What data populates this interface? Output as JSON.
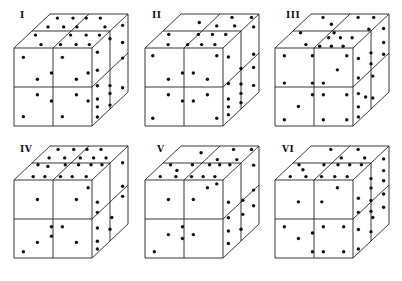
{
  "figure": {
    "line_color": "#222222",
    "dot_color": "#111111",
    "background": "#ffffff"
  },
  "cubes": [
    {
      "label": "I",
      "origin": [
        14,
        48
      ],
      "size": 78,
      "depth": [
        36,
        -34
      ],
      "label_pos": [
        20,
        10
      ],
      "front": [
        [
          0.12,
          0.12
        ],
        [
          0.3,
          0.4
        ],
        [
          0.48,
          0.68
        ],
        [
          0.62,
          0.12
        ],
        [
          0.8,
          0.4
        ],
        [
          0.95,
          0.68
        ],
        [
          0.12,
          0.88
        ],
        [
          0.3,
          0.6
        ],
        [
          0.48,
          0.32
        ],
        [
          0.62,
          0.88
        ],
        [
          0.8,
          0.6
        ],
        [
          0.95,
          0.32
        ]
      ],
      "top": [
        [
          0.15,
          0.12
        ],
        [
          0.35,
          0.12
        ],
        [
          0.52,
          0.12
        ],
        [
          0.7,
          0.12
        ],
        [
          0.15,
          0.38
        ],
        [
          0.35,
          0.38
        ],
        [
          0.52,
          0.38
        ],
        [
          0.88,
          0.38
        ],
        [
          0.1,
          0.62
        ],
        [
          0.55,
          0.62
        ],
        [
          0.75,
          0.62
        ],
        [
          0.92,
          0.62
        ],
        [
          0.3,
          0.9
        ],
        [
          0.55,
          0.9
        ],
        [
          0.75,
          0.9
        ],
        [
          0.92,
          0.9
        ]
      ],
      "right": [
        [
          0.15,
          0.12
        ],
        [
          0.5,
          0.1
        ],
        [
          0.85,
          0.08
        ],
        [
          0.15,
          0.35
        ],
        [
          0.85,
          0.3
        ],
        [
          0.15,
          0.55
        ],
        [
          0.85,
          0.5
        ],
        [
          0.15,
          0.72
        ],
        [
          0.5,
          0.7
        ],
        [
          0.15,
          0.82
        ],
        [
          0.5,
          0.8
        ],
        [
          0.15,
          0.95
        ],
        [
          0.5,
          0.95
        ],
        [
          0.85,
          0.88
        ]
      ]
    },
    {
      "label": "II",
      "origin": [
        145,
        48
      ],
      "size": 78,
      "depth": [
        36,
        -34
      ],
      "label_pos": [
        152,
        10
      ],
      "front": [
        [
          0.1,
          0.1
        ],
        [
          0.3,
          0.4
        ],
        [
          0.48,
          0.68
        ],
        [
          0.62,
          0.68
        ],
        [
          0.8,
          0.4
        ],
        [
          0.92,
          0.1
        ],
        [
          0.48,
          0.32
        ],
        [
          0.3,
          0.6
        ],
        [
          0.1,
          0.9
        ],
        [
          0.62,
          0.32
        ],
        [
          0.8,
          0.6
        ],
        [
          0.92,
          0.9
        ]
      ],
      "top": [
        [
          0.35,
          0.25
        ],
        [
          0.7,
          0.1
        ],
        [
          0.95,
          0.1
        ],
        [
          0.62,
          0.35
        ],
        [
          0.85,
          0.35
        ],
        [
          0.12,
          0.6
        ],
        [
          0.5,
          0.6
        ],
        [
          0.68,
          0.6
        ],
        [
          0.85,
          0.6
        ],
        [
          0.25,
          0.9
        ],
        [
          0.5,
          0.9
        ],
        [
          0.68,
          0.9
        ],
        [
          0.85,
          0.9
        ]
      ],
      "right": [
        [
          0.15,
          0.18
        ],
        [
          0.85,
          0.1
        ],
        [
          0.15,
          0.52
        ],
        [
          0.5,
          0.48
        ],
        [
          0.85,
          0.45
        ],
        [
          0.15,
          0.72
        ],
        [
          0.5,
          0.68
        ],
        [
          0.85,
          0.62
        ],
        [
          0.15,
          0.82
        ],
        [
          0.5,
          0.8
        ],
        [
          0.15,
          0.92
        ],
        [
          0.5,
          0.92
        ],
        [
          0.85,
          0.85
        ]
      ]
    },
    {
      "label": "III",
      "origin": [
        275,
        48
      ],
      "size": 78,
      "depth": [
        36,
        -34
      ],
      "label_pos": [
        286,
        10
      ],
      "front": [
        [
          0.12,
          0.1
        ],
        [
          0.48,
          0.1
        ],
        [
          0.12,
          0.45
        ],
        [
          0.48,
          0.45
        ],
        [
          0.62,
          0.45
        ],
        [
          0.8,
          0.28
        ],
        [
          0.92,
          0.1
        ],
        [
          0.48,
          0.6
        ],
        [
          0.3,
          0.75
        ],
        [
          0.12,
          0.92
        ],
        [
          0.62,
          0.6
        ],
        [
          0.92,
          0.6
        ],
        [
          0.62,
          0.92
        ],
        [
          0.92,
          0.92
        ]
      ],
      "top": [
        [
          0.2,
          0.1
        ],
        [
          0.4,
          0.3
        ],
        [
          0.55,
          0.55
        ],
        [
          0.65,
          0.1
        ],
        [
          0.85,
          0.1
        ],
        [
          0.12,
          0.55
        ],
        [
          0.35,
          0.9
        ],
        [
          0.95,
          0.45
        ],
        [
          0.55,
          0.7
        ],
        [
          0.7,
          0.7
        ],
        [
          0.85,
          0.7
        ],
        [
          0.55,
          0.95
        ],
        [
          0.7,
          0.95
        ],
        [
          0.85,
          0.95
        ]
      ],
      "right": [
        [
          0.15,
          0.2
        ],
        [
          0.85,
          0.12
        ],
        [
          0.5,
          0.28
        ],
        [
          0.85,
          0.3
        ],
        [
          0.15,
          0.45
        ],
        [
          0.5,
          0.42
        ],
        [
          0.85,
          0.45
        ],
        [
          0.15,
          0.65
        ],
        [
          0.55,
          0.6
        ],
        [
          0.15,
          0.82
        ],
        [
          0.35,
          0.78
        ],
        [
          0.55,
          0.88
        ],
        [
          0.15,
          0.95
        ]
      ]
    },
    {
      "label": "IV",
      "origin": [
        14,
        180
      ],
      "size": 78,
      "depth": [
        36,
        -34
      ],
      "label_pos": [
        20,
        144
      ],
      "front": [
        [
          0.3,
          0.25
        ],
        [
          0.48,
          0.6
        ],
        [
          0.8,
          0.25
        ],
        [
          0.95,
          0.1
        ],
        [
          0.62,
          0.6
        ],
        [
          0.48,
          0.72
        ],
        [
          0.3,
          0.8
        ],
        [
          0.12,
          0.92
        ],
        [
          0.8,
          0.8
        ]
      ],
      "top": [
        [
          0.15,
          0.1
        ],
        [
          0.35,
          0.1
        ],
        [
          0.52,
          0.1
        ],
        [
          0.7,
          0.1
        ],
        [
          0.15,
          0.35
        ],
        [
          0.35,
          0.35
        ],
        [
          0.55,
          0.35
        ],
        [
          0.72,
          0.35
        ],
        [
          0.88,
          0.35
        ],
        [
          0.1,
          0.55
        ],
        [
          0.25,
          0.6
        ],
        [
          0.45,
          0.55
        ],
        [
          0.62,
          0.55
        ],
        [
          0.78,
          0.55
        ],
        [
          0.92,
          0.55
        ],
        [
          0.2,
          0.9
        ],
        [
          0.35,
          0.9
        ],
        [
          0.55,
          0.9
        ],
        [
          0.7,
          0.9
        ],
        [
          0.88,
          0.9
        ]
      ],
      "right": [
        [
          0.85,
          0.15
        ],
        [
          0.15,
          0.35
        ],
        [
          0.85,
          0.45
        ],
        [
          0.15,
          0.48
        ],
        [
          0.85,
          0.58
        ],
        [
          0.15,
          0.68
        ],
        [
          0.15,
          0.85
        ],
        [
          0.55,
          0.72
        ],
        [
          0.5,
          0.85
        ],
        [
          0.15,
          0.95
        ]
      ]
    },
    {
      "label": "V",
      "origin": [
        145,
        180
      ],
      "size": 78,
      "depth": [
        36,
        -34
      ],
      "label_pos": [
        157,
        144
      ],
      "front": [
        [
          0.3,
          0.25
        ],
        [
          0.48,
          0.75
        ],
        [
          0.62,
          0.25
        ],
        [
          0.8,
          0.1
        ],
        [
          0.3,
          0.7
        ],
        [
          0.12,
          0.92
        ],
        [
          0.62,
          0.7
        ],
        [
          0.48,
          0.6
        ],
        [
          0.92,
          0.05
        ]
      ],
      "top": [
        [
          0.35,
          0.2
        ],
        [
          0.72,
          0.1
        ],
        [
          0.95,
          0.1
        ],
        [
          0.65,
          0.4
        ],
        [
          0.9,
          0.4
        ],
        [
          0.12,
          0.55
        ],
        [
          0.4,
          0.55
        ],
        [
          0.62,
          0.55
        ],
        [
          0.75,
          0.55
        ],
        [
          0.88,
          0.55
        ],
        [
          0.28,
          0.72
        ],
        [
          0.15,
          0.9
        ],
        [
          0.35,
          0.9
        ],
        [
          0.55,
          0.9
        ],
        [
          0.7,
          0.9
        ],
        [
          0.85,
          0.9
        ]
      ],
      "right": [
        [
          0.85,
          0.18
        ],
        [
          0.15,
          0.35
        ],
        [
          0.15,
          0.55
        ],
        [
          0.55,
          0.5
        ],
        [
          0.85,
          0.5
        ],
        [
          0.15,
          0.72
        ],
        [
          0.55,
          0.68
        ],
        [
          0.15,
          0.88
        ],
        [
          0.5,
          0.85
        ],
        [
          0.85,
          0.7
        ]
      ]
    },
    {
      "label": "VI",
      "origin": [
        275,
        180
      ],
      "size": 78,
      "depth": [
        36,
        -34
      ],
      "label_pos": [
        282,
        144
      ],
      "front": [
        [
          0.3,
          0.28
        ],
        [
          0.6,
          0.28
        ],
        [
          0.8,
          0.1
        ],
        [
          0.48,
          0.68
        ],
        [
          0.12,
          0.6
        ],
        [
          0.3,
          0.75
        ],
        [
          0.48,
          0.92
        ],
        [
          0.62,
          0.6
        ],
        [
          0.62,
          0.92
        ],
        [
          0.88,
          0.6
        ],
        [
          0.88,
          0.92
        ]
      ],
      "top": [
        [
          0.3,
          0.1
        ],
        [
          0.65,
          0.1
        ],
        [
          0.55,
          0.35
        ],
        [
          0.85,
          0.35
        ],
        [
          0.1,
          0.55
        ],
        [
          0.22,
          0.7
        ],
        [
          0.42,
          0.55
        ],
        [
          0.6,
          0.55
        ],
        [
          0.75,
          0.55
        ],
        [
          0.9,
          0.55
        ],
        [
          0.15,
          0.9
        ],
        [
          0.35,
          0.9
        ],
        [
          0.55,
          0.9
        ],
        [
          0.72,
          0.9
        ],
        [
          0.88,
          0.9
        ]
      ],
      "right": [
        [
          0.85,
          0.1
        ],
        [
          0.5,
          0.2
        ],
        [
          0.85,
          0.25
        ],
        [
          0.15,
          0.3
        ],
        [
          0.5,
          0.32
        ],
        [
          0.85,
          0.38
        ],
        [
          0.15,
          0.48
        ],
        [
          0.5,
          0.48
        ],
        [
          0.85,
          0.55
        ],
        [
          0.5,
          0.62
        ],
        [
          0.15,
          0.7
        ],
        [
          0.55,
          0.72
        ],
        [
          0.85,
          0.72
        ],
        [
          0.5,
          0.88
        ],
        [
          0.15,
          0.95
        ]
      ]
    }
  ]
}
